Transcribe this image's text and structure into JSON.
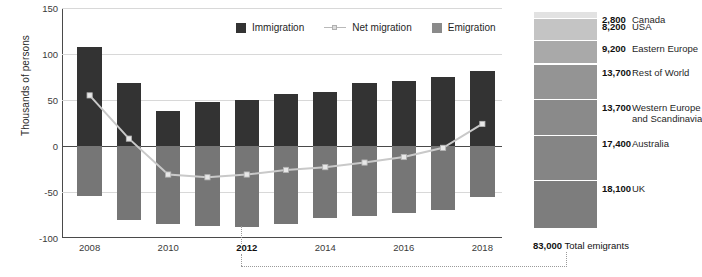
{
  "chart_data": {
    "type": "bar",
    "title": "",
    "xlabel": "",
    "ylabel": "Thousands of persons",
    "ylim": [
      -100,
      150
    ],
    "yticks": [
      150,
      100,
      50,
      0,
      -50,
      -100
    ],
    "grid": true,
    "legend_position": "top-center",
    "categories": [
      2008,
      2009,
      2010,
      2011,
      2012,
      2013,
      2014,
      2015,
      2016,
      2017,
      2018
    ],
    "xticks": [
      "2008",
      "2010",
      "2012",
      "2014",
      "2016",
      "2018"
    ],
    "xtick_highlight": "2012",
    "series": [
      {
        "name": "Immigration",
        "type": "bar",
        "values": [
          108,
          69,
          38,
          48,
          50,
          56,
          59,
          68,
          71,
          75,
          81
        ]
      },
      {
        "name": "Emigration",
        "type": "bar",
        "values": [
          -54,
          -80,
          -85,
          -87,
          -88,
          -85,
          -78,
          -76,
          -73,
          -70,
          -55
        ]
      },
      {
        "name": "Net migration",
        "type": "line",
        "values": [
          55,
          8,
          -31,
          -34,
          -31,
          -26,
          -23,
          -18,
          -12,
          -2,
          24
        ]
      }
    ]
  },
  "legend": {
    "items": [
      {
        "label": "Immigration",
        "swatch": "dark"
      },
      {
        "label": "Net migration",
        "swatch": "line"
      },
      {
        "label": "Emigration",
        "swatch": "gray"
      }
    ]
  },
  "stacked_panel": {
    "type": "stacked-bar",
    "segments": [
      {
        "value": "2,800",
        "label": "Canada",
        "amount": 2800,
        "color": "#e2e2e2"
      },
      {
        "value": "8,200",
        "label": "USA",
        "amount": 8200,
        "color": "#c4c4c4"
      },
      {
        "value": "9,200",
        "label": "Eastern Europe",
        "amount": 9200,
        "color": "#a9a9a9"
      },
      {
        "value": "13,700",
        "label": "Rest of World",
        "amount": 13700,
        "color": "#949494"
      },
      {
        "value": "13,700",
        "label": "Western Europe\nand Scandinavia",
        "amount": 13700,
        "color": "#8a8a8a"
      },
      {
        "value": "17,400",
        "label": "Australia",
        "amount": 17400,
        "color": "#858585"
      },
      {
        "value": "18,100",
        "label": "UK",
        "amount": 18100,
        "color": "#7d7d7d"
      }
    ],
    "total_value": "83,000",
    "total_label": "Total emigrants"
  },
  "colors": {
    "immigration": "#333333",
    "emigration": "#767676",
    "net_line": "#c9c9c9",
    "axis": "#4a4a4a",
    "grid": "#d8d8d8",
    "background": "#ffffff"
  }
}
